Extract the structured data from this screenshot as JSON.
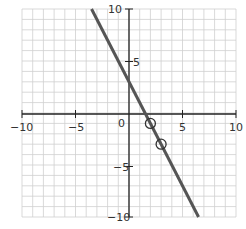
{
  "chart_data": {
    "type": "line",
    "title": "",
    "xlabel": "",
    "ylabel": "",
    "xlim": [
      -10,
      10
    ],
    "ylim": [
      -10,
      10
    ],
    "grid": true,
    "x_ticks": [
      "-10",
      "-5",
      "0",
      "5",
      "10"
    ],
    "y_ticks": [
      "10",
      "5",
      "-5",
      "-10"
    ],
    "series": [
      {
        "name": "line",
        "equation": "y = -2x + 3",
        "x": [
          -3.5,
          6.5
        ],
        "y": [
          10,
          -10
        ],
        "color": "#555555"
      }
    ],
    "points": [
      {
        "x": 2,
        "y": -1,
        "marker": "open-circle"
      },
      {
        "x": 3,
        "y": -3,
        "marker": "open-circle"
      }
    ]
  },
  "labels": {
    "x_neg10": "−10",
    "x_neg5": "−5",
    "origin": "0",
    "x_5": "5",
    "x_10": "10",
    "y_10": "10",
    "y_5": "5",
    "y_neg5": "−5",
    "y_neg10": "−10"
  }
}
